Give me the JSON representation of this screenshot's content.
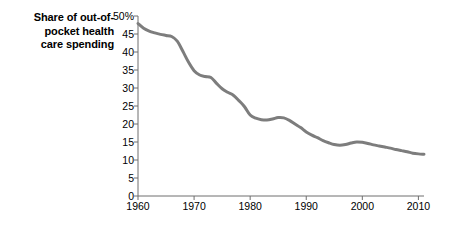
{
  "chart_data": {
    "type": "line",
    "title_lines": [
      "Share of out-of-",
      "pocket health",
      "care spending"
    ],
    "xlabel": "",
    "ylabel": "",
    "xlim": [
      1960,
      2011
    ],
    "ylim": [
      0,
      50
    ],
    "grid": false,
    "legend": false,
    "legend_position": "none",
    "line_color": "#7d7d7d",
    "axis_color": "#6e6e6e",
    "y_ticks": [
      0,
      5,
      10,
      15,
      20,
      25,
      30,
      35,
      40,
      45,
      50
    ],
    "y_tick_labels": [
      "0",
      "5",
      "10",
      "15",
      "20",
      "25",
      "30",
      "35",
      "40",
      "45",
      "50%"
    ],
    "x_ticks": [
      1960,
      1970,
      1980,
      1990,
      2000,
      2010
    ],
    "x_tick_labels": [
      "1960",
      "1970",
      "1980",
      "1990",
      "2000",
      "2010"
    ],
    "series": [
      {
        "name": "Share of out-of-pocket health care spending",
        "x": [
          1960,
          1961,
          1962,
          1963,
          1964,
          1965,
          1966,
          1967,
          1968,
          1969,
          1970,
          1971,
          1972,
          1973,
          1974,
          1975,
          1976,
          1977,
          1978,
          1979,
          1980,
          1981,
          1982,
          1983,
          1984,
          1985,
          1986,
          1987,
          1988,
          1989,
          1990,
          1991,
          1992,
          1993,
          1994,
          1995,
          1996,
          1997,
          1998,
          1999,
          2000,
          2001,
          2002,
          2003,
          2004,
          2005,
          2006,
          2007,
          2008,
          2009,
          2010,
          2011
        ],
        "values": [
          47.9,
          46.6,
          45.8,
          45.3,
          44.9,
          44.6,
          44.3,
          43.0,
          40.2,
          37.2,
          34.8,
          33.6,
          33.2,
          32.9,
          31.3,
          29.8,
          28.8,
          28.0,
          26.5,
          24.8,
          22.5,
          21.6,
          21.2,
          21.1,
          21.4,
          21.8,
          21.7,
          21.0,
          20.0,
          19.0,
          17.8,
          16.9,
          16.2,
          15.4,
          14.8,
          14.3,
          14.1,
          14.3,
          14.7,
          15.0,
          14.9,
          14.6,
          14.2,
          13.9,
          13.6,
          13.3,
          12.9,
          12.6,
          12.3,
          11.9,
          11.7,
          11.6
        ]
      }
    ]
  },
  "axis": {
    "y_unit_suffix": "%"
  }
}
